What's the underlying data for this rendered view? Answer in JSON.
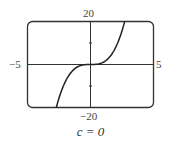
{
  "chart_data": {
    "type": "line",
    "title": "",
    "caption": "c = 0",
    "function": "y = x^3 + c x, c = 0",
    "xlim": [
      -5,
      5
    ],
    "ylim": [
      -20,
      20
    ],
    "x_tick_labels": [
      "-5",
      "5"
    ],
    "y_tick_labels": [
      "-20",
      "20"
    ],
    "y_minor_ticks": [
      -10,
      10
    ],
    "grid": false,
    "series": [
      {
        "name": "f(x)",
        "x": [
          -2.714,
          -2.5,
          -2,
          -1.5,
          -1,
          -0.5,
          0,
          0.5,
          1,
          1.5,
          2,
          2.5,
          2.714
        ],
        "y": [
          -20,
          -15.63,
          -8,
          -3.38,
          -1,
          -0.13,
          0,
          0.13,
          1,
          3.38,
          8,
          15.63,
          20
        ]
      }
    ]
  },
  "labels": {
    "y_max": "20",
    "y_min": "−20",
    "x_min": "−5",
    "x_max": "5",
    "caption_var": "c",
    "caption": "c = 0"
  },
  "colors": {
    "frame": "#333333",
    "curve": "#222222",
    "axis": "#333333"
  }
}
